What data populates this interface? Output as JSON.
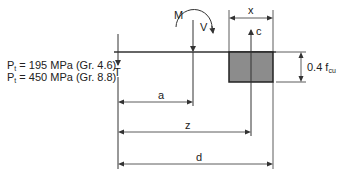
{
  "diagram": {
    "type": "bolt-group stress block",
    "labels": {
      "moment": "M",
      "shear": "V",
      "tension": "T",
      "compression": "c",
      "block_depth": "x",
      "stress_prefix": "0.4 f",
      "stress_sub": "cu",
      "dim_a": "a",
      "dim_z": "z",
      "dim_d": "d"
    },
    "notes": [
      {
        "prefix": "P",
        "sub": "t",
        "text": " = 195 MPa (Gr. 4.6)"
      },
      {
        "prefix": "P",
        "sub": "t",
        "text": " = 450 MPa (Gr. 8.8)"
      }
    ],
    "colors": {
      "line": "#333333",
      "block_fill": "#8c8c8c",
      "block_stroke": "#222222"
    }
  }
}
